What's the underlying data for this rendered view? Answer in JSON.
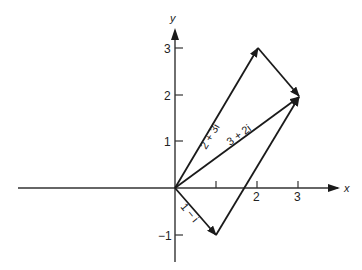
{
  "diagram": {
    "title": "",
    "axes": {
      "x_label": "x",
      "y_label": "y",
      "x_ticks": [
        {
          "value": 1,
          "label": ""
        },
        {
          "value": 2,
          "label": "2"
        },
        {
          "value": 3,
          "label": "3"
        }
      ],
      "y_ticks": [
        {
          "value": 3,
          "label": "3"
        },
        {
          "value": 2,
          "label": "2"
        },
        {
          "value": 1,
          "label": "1"
        },
        {
          "value": -1,
          "label": "−1"
        }
      ]
    },
    "vectors": [
      {
        "name": "2+3i",
        "label": "2 + 3i",
        "from": [
          0,
          0
        ],
        "to": [
          2,
          3
        ]
      },
      {
        "name": "3+2i",
        "label": "3 + 2i",
        "from": [
          0,
          0
        ],
        "to": [
          3,
          2
        ]
      },
      {
        "name": "1-i",
        "label": "1 − i",
        "from": [
          0,
          0
        ],
        "to": [
          1,
          -1
        ]
      }
    ],
    "connectors": [
      {
        "from": [
          2,
          3
        ],
        "to": [
          3,
          2
        ],
        "arrow": true
      },
      {
        "from": [
          1,
          -1
        ],
        "to": [
          3,
          2
        ],
        "arrow": true
      }
    ],
    "colors": {
      "line": "#1a1a1a",
      "axis": "#333333",
      "background": "#ffffff"
    }
  }
}
